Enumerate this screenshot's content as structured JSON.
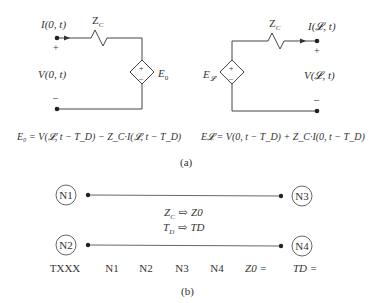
{
  "figure_a": {
    "caption": "(a)",
    "left_circuit": {
      "current_label": "I(0, t)",
      "impedance_label": "Z",
      "impedance_sub": "C",
      "plus": "+",
      "minus": "–",
      "voltage_label": "V(0, t)",
      "source_label": "E",
      "source_sub": "0",
      "source_plus": "+",
      "source_minus": "–",
      "equation": "E₀ = V(𝓛, t − T_D) − Z_C·I(𝓛, t − T_D)"
    },
    "right_circuit": {
      "current_label": "I(𝓛, t)",
      "impedance_label": "Z",
      "impedance_sub": "C",
      "plus": "+",
      "minus": "–",
      "voltage_label": "V(𝓛, t)",
      "source_label": "E",
      "source_sub": "𝓛",
      "source_plus": "+",
      "source_minus": "–",
      "equation": "E𝓛 = V(0, t − T_D) + Z_C·I(0, t − T_D)"
    }
  },
  "figure_b": {
    "caption": "(b)",
    "nodes": [
      "N1",
      "N2",
      "N3",
      "N4"
    ],
    "mapping": [
      {
        "from": "Z",
        "from_sub": "C",
        "arrow": "⇨",
        "to": "Z0"
      },
      {
        "from": "T",
        "from_sub": "D",
        "arrow": "⇨",
        "to": "TD"
      }
    ],
    "syntax_row": [
      "TXXX",
      "N1",
      "N2",
      "N3",
      "N4",
      "Z0 =",
      "TD ="
    ]
  }
}
